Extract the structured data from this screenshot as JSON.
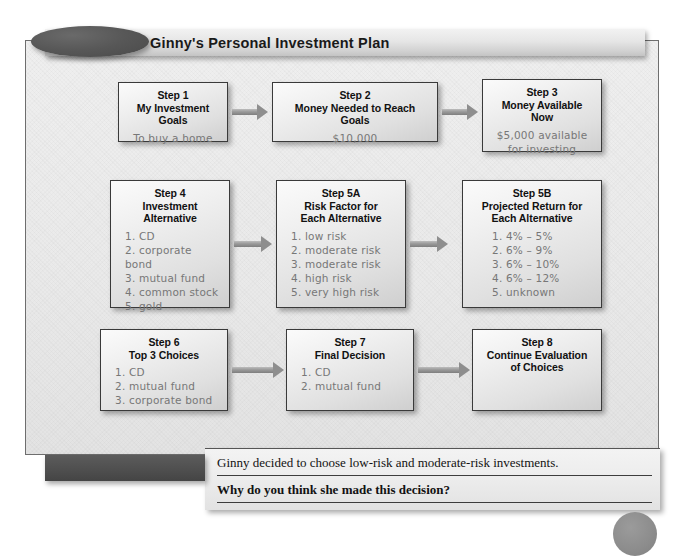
{
  "figure": {
    "number_label": "Figure 8.5",
    "title": "Ginny's Personal Investment Plan"
  },
  "steps": [
    {
      "id": "step-1",
      "title": "Step 1\nMy Investment Goals",
      "body": "To buy a home",
      "body_align": "center"
    },
    {
      "id": "step-2",
      "title": "Step 2\nMoney Needed to Reach Goals",
      "body": "$10,000",
      "body_align": "center"
    },
    {
      "id": "step-3",
      "title": "Step 3\nMoney Available Now",
      "body": "$5,000 available\nfor investing",
      "body_align": "center"
    },
    {
      "id": "step-4",
      "title": "Step 4\nInvestment\nAlternative",
      "body": "1. CD\n2. corporate bond\n3. mutual fund\n4. common stock\n5. gold",
      "body_align": "left"
    },
    {
      "id": "step-5a",
      "title": "Step 5A\nRisk Factor for\nEach Alternative",
      "body": "1. low risk\n2. moderate risk\n3. moderate risk\n4. high risk\n5. very high risk",
      "body_align": "left"
    },
    {
      "id": "step-5b",
      "title": "Step 5B\nProjected Return for\nEach Alternative",
      "body": "1. 4% – 5%\n2. 6% – 9%\n3. 6% – 10%\n4. 6% – 12%\n5. unknown",
      "body_align": "indent"
    },
    {
      "id": "step-6",
      "title": "Step 6\nTop 3 Choices",
      "body": "1. CD\n2. mutual fund\n3. corporate bond",
      "body_align": "left"
    },
    {
      "id": "step-7",
      "title": "Step 7\nFinal Decision",
      "body": "1. CD\n2. mutual fund",
      "body_align": "left"
    },
    {
      "id": "step-8",
      "title": "Step 8\nContinue Evaluation\nof Choices",
      "body": "",
      "body_align": "center"
    }
  ],
  "master_plan": {
    "label": "Master Plan",
    "statement": "Ginny decided to choose low-risk and moderate-risk investments.",
    "question": "Why do you think she made this decision?"
  },
  "colors": {
    "frame_border": "#6e6e6e",
    "pill_fill": "#4a4a4a",
    "master_plan_fill": "#4e4e4e",
    "box_border": "#3a3a3a",
    "handwriting_text": "#777777",
    "arrow_fill": "#8e8e8e"
  }
}
